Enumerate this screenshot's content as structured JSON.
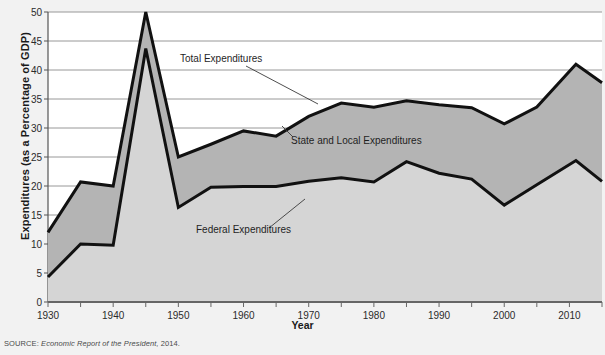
{
  "chart_data": {
    "type": "area",
    "title": "",
    "xlabel": "Year",
    "ylabel": "Expenditures (as a Percentage of GDP)",
    "xlim": [
      1930,
      2015
    ],
    "ylim": [
      0,
      50
    ],
    "ytick_step": 5,
    "xtick_label_step": 10,
    "xtick_minor_step": 5,
    "grid": true,
    "legend_position": "inline-annotations",
    "x": [
      1930,
      1935,
      1940,
      1945,
      1950,
      1955,
      1960,
      1965,
      1970,
      1975,
      1980,
      1985,
      1990,
      1995,
      2000,
      2005,
      2011,
      2015
    ],
    "y_ticks": [
      0,
      5,
      10,
      15,
      20,
      25,
      30,
      35,
      40,
      45,
      50
    ],
    "x_tick_labels": [
      "1930",
      "1940",
      "1950",
      "1960",
      "1970",
      "1980",
      "1990",
      "2000",
      "2010"
    ],
    "series": [
      {
        "name": "Total Expenditures",
        "key": "total",
        "fill_color": "#b4b4b4",
        "line_color": "#111111",
        "values": [
          12.0,
          20.7,
          20.0,
          50.0,
          25.0,
          27.2,
          29.5,
          28.6,
          32.0,
          34.3,
          33.6,
          34.7,
          34.0,
          33.5,
          30.7,
          33.6,
          41.0,
          37.8
        ]
      },
      {
        "name": "Federal Expenditures",
        "key": "federal",
        "fill_color": "#d5d5d5",
        "line_color": "#111111",
        "values": [
          4.3,
          10.0,
          9.8,
          43.7,
          16.3,
          19.8,
          19.9,
          19.9,
          20.8,
          21.4,
          20.7,
          24.2,
          22.2,
          21.2,
          16.7,
          20.2,
          24.4,
          20.8
        ]
      }
    ],
    "band": {
      "name": "State and Local Expenditures",
      "description": "Shaded band between Total Expenditures and Federal Expenditures",
      "fill_color": "#b4b4b4"
    },
    "annotations": [
      {
        "key": "total",
        "text": "Total Expenditures",
        "text_x_px": 180,
        "text_y_px": 62,
        "leader_from_px": [
          246,
          66
        ],
        "leader_to_px": [
          318,
          104
        ]
      },
      {
        "key": "state_local",
        "text": "State and Local Expenditures",
        "text_x_px": 291,
        "text_y_px": 144,
        "leader_from_px": [
          293,
          137
        ],
        "leader_to_px": [
          282,
          126
        ]
      },
      {
        "key": "federal",
        "text": "Federal Expenditures",
        "text_x_px": 196,
        "text_y_px": 233,
        "leader_from_px": [
          269,
          228
        ],
        "leader_to_px": [
          305,
          199
        ]
      }
    ]
  },
  "source": {
    "label": "SOURCE:",
    "body": "Economic Report of the President,",
    "year": "2014."
  },
  "colors": {
    "background": "#f2f2f2",
    "plot_background": "#ffffff",
    "grid": "#8c8c8c",
    "axis": "#555555",
    "total_fill": "#b4b4b4",
    "federal_fill": "#d5d5d5",
    "line": "#111111",
    "text": "#1a1a1a"
  }
}
